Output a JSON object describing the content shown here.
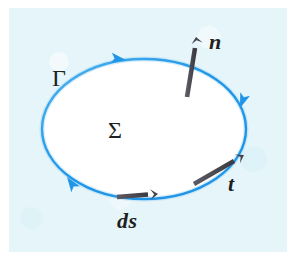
{
  "figure": {
    "width": 295,
    "height": 260,
    "page_background": "#ffffff",
    "panel_background": "#e6f5f9"
  },
  "colors": {
    "curve_blue": "#2196e8",
    "curve_blue_light": "#63bdf0",
    "vector_gray": "#4d4c54",
    "label_ink": "#211f20",
    "surface_fill": "#ffffff"
  },
  "boundary_curve": {
    "name": "Gamma",
    "label": "Γ",
    "shape": "ellipse",
    "center_x": 144,
    "center_y": 129,
    "radius_x": 102,
    "radius_y": 70,
    "stroke_width": 2.4,
    "orientation": "counter-clockwise",
    "direction_arrow_count": 3
  },
  "surface": {
    "name": "Sigma",
    "label": "Σ",
    "fill": "#ffffff"
  },
  "vectors": [
    {
      "name": "normal",
      "label": "n",
      "style": "bold-italic",
      "color": "#4d4c54",
      "x1": 187,
      "y1": 97,
      "x2": 197,
      "y2": 37,
      "shaft_width": 4.6,
      "label_x": 209,
      "label_y": 31
    },
    {
      "name": "tangent",
      "label": "t",
      "style": "bold-italic",
      "color": "#4d4c54",
      "x1": 194,
      "y1": 184,
      "x2": 243,
      "y2": 155,
      "shaft_width": 4.4,
      "label_x": 228,
      "label_y": 173
    },
    {
      "name": "line-element",
      "label": "ds",
      "style": "bold-italic",
      "color": "#4d4c54",
      "x1": 117,
      "y1": 197,
      "x2": 157,
      "y2": 194,
      "shaft_width": 4.4,
      "label_x": 117,
      "label_y": 210
    }
  ],
  "curve_direction_arrows": [
    {
      "name": "top-arrow",
      "x": 126,
      "y": 60,
      "angle_deg": 188
    },
    {
      "name": "left-arrow",
      "x": 67,
      "y": 177,
      "angle_deg": 55
    },
    {
      "name": "right-arrow",
      "x": 240,
      "y": 108,
      "angle_deg": 290
    }
  ],
  "labels": {
    "gamma": "Γ",
    "sigma": "Σ",
    "normal": "n",
    "tangent": "t",
    "line_element": "ds"
  },
  "label_positions": {
    "gamma": {
      "x": 52,
      "y": 66
    },
    "sigma": {
      "x": 108,
      "y": 118
    }
  }
}
